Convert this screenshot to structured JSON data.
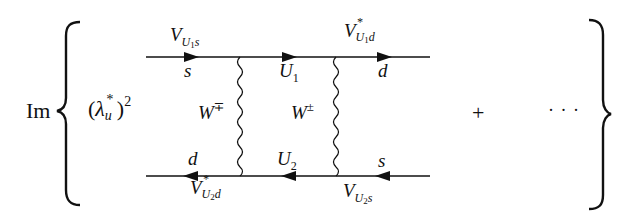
{
  "expression": {
    "operator": "Im",
    "prefactor": {
      "base": "λ",
      "base_sub": "u",
      "base_sup": "*",
      "power": "2"
    },
    "plus": "+",
    "ellipsis": "· · ·"
  },
  "diagram": {
    "type": "box-feynman-diagram",
    "top_line": {
      "particles": [
        {
          "label": "s",
          "position": "left"
        },
        {
          "label": "U",
          "sub": "1",
          "position": "middle"
        },
        {
          "label": "d",
          "position": "right"
        }
      ],
      "vertices": [
        {
          "label": "V",
          "sub": "U",
          "subsub": "1",
          "tail": "s",
          "conj": ""
        },
        {
          "label": "V",
          "sub": "U",
          "subsub": "1",
          "tail": "d",
          "conj": "*"
        }
      ],
      "arrow_direction": "right"
    },
    "bottom_line": {
      "particles": [
        {
          "label": "d",
          "position": "left"
        },
        {
          "label": "U",
          "sub": "2",
          "position": "middle"
        },
        {
          "label": "s",
          "position": "right"
        }
      ],
      "vertices": [
        {
          "label": "V",
          "sub": "U",
          "subsub": "2",
          "tail": "d",
          "conj": "*"
        },
        {
          "label": "V",
          "sub": "U",
          "subsub": "2",
          "tail": "s",
          "conj": ""
        }
      ],
      "arrow_direction": "left"
    },
    "bosons": [
      {
        "label": "W",
        "sup": "∓"
      },
      {
        "label": "W",
        "sup": "±"
      }
    ]
  },
  "colors": {
    "ink": "#111111",
    "background": "#ffffff"
  }
}
